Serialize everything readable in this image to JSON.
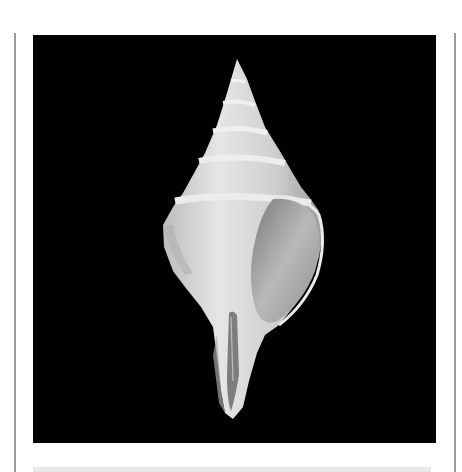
{
  "figure": {
    "background_color": "#000000",
    "shell_color": "#d9d9d9"
  },
  "caption": {
    "text": ""
  }
}
